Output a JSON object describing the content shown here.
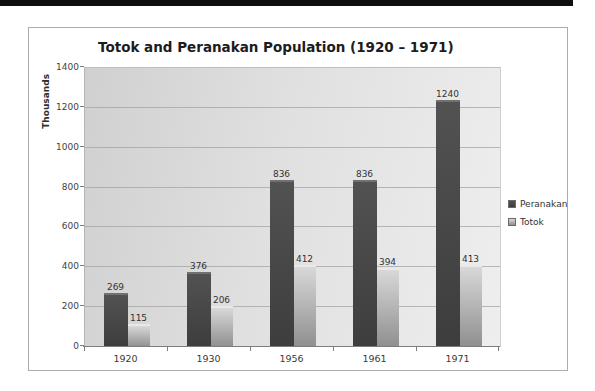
{
  "page": {
    "top_bar_color": "#0f0f0f"
  },
  "chart_data": {
    "type": "bar",
    "title": "Totok and Peranakan Population (1920 – 1971)",
    "ylabel": "Thousands",
    "xlabel": "",
    "categories": [
      "1920",
      "1930",
      "1956",
      "1961",
      "1971"
    ],
    "series": [
      {
        "name": "Peranakan",
        "values": [
          269,
          376,
          836,
          836,
          1240
        ],
        "color_top": "#525252",
        "color_bottom": "#3d3d3d",
        "bevel": "#717171"
      },
      {
        "name": "Totok",
        "values": [
          115,
          206,
          412,
          394,
          413
        ],
        "color_top": "#d8d8d8",
        "color_bottom": "#8f8f8f",
        "bevel": "#e9e9e9"
      }
    ],
    "ylim": [
      0,
      1400
    ],
    "yticks": [
      0,
      200,
      400,
      600,
      800,
      1000,
      1200,
      1400
    ],
    "grid": true,
    "legend_position": "right",
    "data_labels": true
  }
}
